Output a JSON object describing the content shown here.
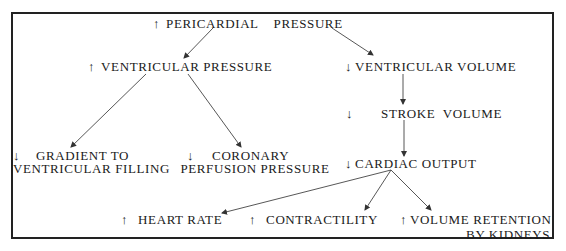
{
  "diagram": {
    "nodes": {
      "pericardial_pressure": {
        "arrow": "↑",
        "direction": "increase",
        "text": "PERICARDIAL    PRESSURE"
      },
      "ventricular_pressure": {
        "arrow": "↑",
        "direction": "increase",
        "text": "VENTRICULAR PRESSURE"
      },
      "ventricular_volume": {
        "arrow": "↓",
        "direction": "decrease",
        "text": "VENTRICULAR VOLUME"
      },
      "stroke_volume": {
        "arrow": "↓",
        "direction": "decrease",
        "text": "STROKE  VOLUME"
      },
      "gradient_filling": {
        "arrow": "↓",
        "direction": "decrease",
        "line1": "GRADIENT TO",
        "line2": "VENTRICULAR FILLING"
      },
      "coronary_perfusion": {
        "arrow": "↓",
        "direction": "decrease",
        "line1": "CORONARY",
        "line2": "PERFUSION PRESSURE"
      },
      "cardiac_output": {
        "arrow": "↓",
        "direction": "decrease",
        "text": "CARDIAC OUTPUT"
      },
      "heart_rate": {
        "arrow": "↑",
        "direction": "increase",
        "text": "HEART RATE"
      },
      "contractility": {
        "arrow": "↑",
        "direction": "increase",
        "text": "CONTRACTILITY"
      },
      "volume_retention": {
        "arrow": "↑",
        "direction": "increase",
        "line1": "VOLUME RETENTION",
        "line2": "BY KIDNEYS"
      }
    },
    "edges": [
      {
        "from": "pericardial_pressure",
        "to": "ventricular_pressure"
      },
      {
        "from": "pericardial_pressure",
        "to": "ventricular_volume"
      },
      {
        "from": "ventricular_pressure",
        "to": "gradient_filling"
      },
      {
        "from": "ventricular_pressure",
        "to": "coronary_perfusion"
      },
      {
        "from": "ventricular_volume",
        "to": "stroke_volume"
      },
      {
        "from": "stroke_volume",
        "to": "cardiac_output"
      },
      {
        "from": "cardiac_output",
        "to": "heart_rate"
      },
      {
        "from": "cardiac_output",
        "to": "contractility"
      },
      {
        "from": "cardiac_output",
        "to": "volume_retention"
      }
    ]
  }
}
